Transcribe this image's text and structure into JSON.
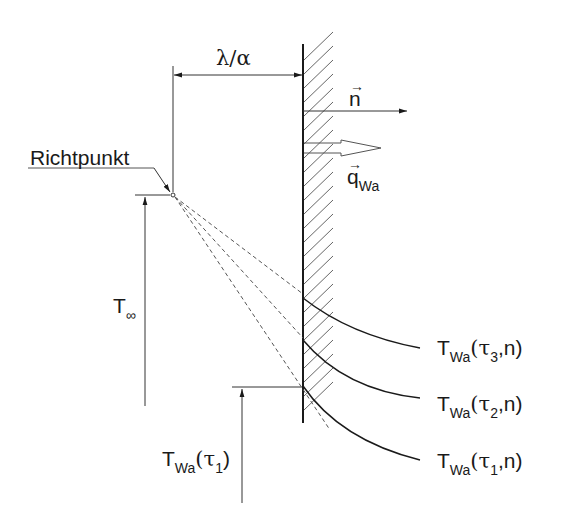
{
  "diagram": {
    "labels": {
      "dimension": "λ/α",
      "richtpunkt": "Richtpunkt",
      "normal_vector": "n",
      "heat_flux_main": "q",
      "heat_flux_sub": "Wa",
      "t_inf_main": "T",
      "t_inf_sub": "∞",
      "t_wall_main": "T",
      "t_wall_sub": "Wa",
      "t_wall_arg": "(τ",
      "t_wall_arg_sub": "1",
      "t_wall_close": ")",
      "curves": [
        {
          "main": "T",
          "sub": "Wa",
          "arg": "(τ",
          "arg_sub": "3",
          "close": ",n)"
        },
        {
          "main": "T",
          "sub": "Wa",
          "arg": "(τ",
          "arg_sub": "2",
          "close": ",n)"
        },
        {
          "main": "T",
          "sub": "Wa",
          "arg": "(τ",
          "arg_sub": "1",
          "close": ",n)"
        }
      ]
    },
    "colors": {
      "line": "#1a1a1a",
      "thin": "#333333",
      "dashed": "#555555"
    }
  }
}
